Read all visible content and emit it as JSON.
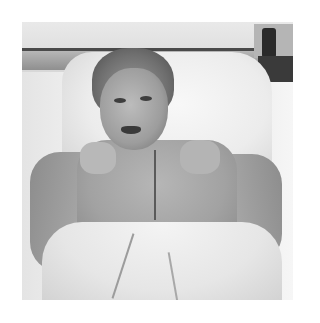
{
  "image": {
    "type": "photograph",
    "color_mode": "grayscale",
    "subject": "man lying in hospital bed showing chest incision",
    "background_color": "#ffffff",
    "photo_bounds": {
      "x": 22,
      "y": 22,
      "width": 271,
      "height": 278
    }
  }
}
